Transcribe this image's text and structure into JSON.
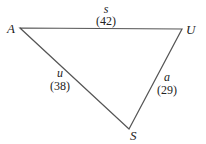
{
  "diagram": {
    "type": "triangle",
    "stroke_color": "#555555",
    "vertices": [
      {
        "label": "A",
        "x": 20,
        "y": 28
      },
      {
        "label": "U",
        "x": 182,
        "y": 29
      },
      {
        "label": "S",
        "x": 129,
        "y": 129
      }
    ],
    "edges": [
      {
        "from": "A",
        "to": "U",
        "name": "s",
        "value": "(42)"
      },
      {
        "from": "A",
        "to": "S",
        "name": "u",
        "value": "(38)"
      },
      {
        "from": "U",
        "to": "S",
        "name": "a",
        "value": "(29)"
      }
    ]
  }
}
